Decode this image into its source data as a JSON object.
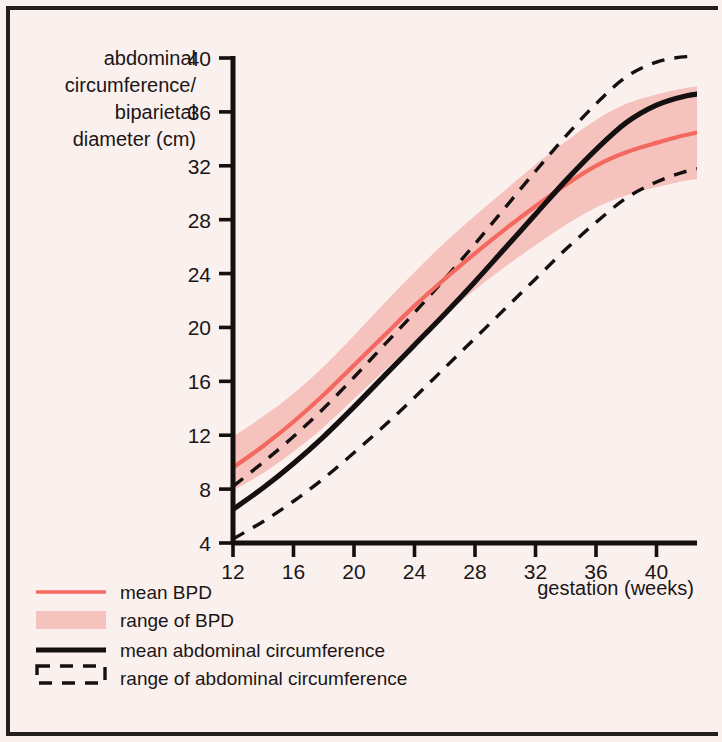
{
  "chart_data": {
    "type": "line",
    "title": "",
    "ylabel_lines": [
      "abdominal",
      "circumference/",
      "biparietal",
      "diameter (cm)"
    ],
    "ylabel": "abdominal circumference/ biparietal diameter (cm)",
    "xlabel": "gestation (weeks)",
    "xlim": [
      12,
      43.5
    ],
    "ylim": [
      4,
      40
    ],
    "xticks": [
      12,
      16,
      20,
      24,
      28,
      32,
      36,
      40
    ],
    "yticks": [
      4,
      8,
      12,
      16,
      20,
      24,
      28,
      32,
      36,
      40
    ],
    "grid": false,
    "legend_position": "below-left",
    "colors": {
      "background": "#faf1ef",
      "bpd_mean_line": "#f4695f",
      "bpd_range_fill": "#f6c2bd",
      "ac_mean_line": "#141010",
      "ac_range_line": "#141010",
      "frame": "#241f1f"
    },
    "x": [
      12,
      14,
      16,
      18,
      20,
      22,
      24,
      26,
      28,
      30,
      32,
      34,
      36,
      38,
      40,
      42,
      43.4
    ],
    "series": [
      {
        "name": "mean BPD",
        "style": "solid-red",
        "values": [
          9.6,
          11.2,
          13.0,
          15.0,
          17.2,
          19.4,
          21.6,
          23.6,
          25.5,
          27.3,
          29.0,
          30.6,
          32.0,
          33.0,
          33.7,
          34.3,
          34.6
        ]
      },
      {
        "name": "range of BPD upper",
        "style": "fill-edge-upper",
        "values": [
          11.9,
          13.4,
          15.1,
          17.1,
          19.4,
          21.8,
          24.1,
          26.3,
          28.3,
          30.2,
          32.1,
          33.8,
          35.4,
          36.6,
          37.3,
          37.8,
          38.0
        ]
      },
      {
        "name": "range of BPD lower",
        "style": "fill-edge-lower",
        "values": [
          7.9,
          9.2,
          10.8,
          12.6,
          14.7,
          16.8,
          18.9,
          20.9,
          22.8,
          24.5,
          26.1,
          27.6,
          28.9,
          29.8,
          30.4,
          30.9,
          31.1
        ]
      },
      {
        "name": "mean abdominal circumference",
        "style": "solid-black",
        "values": [
          6.5,
          8.1,
          9.9,
          11.9,
          14.1,
          16.4,
          18.7,
          21.0,
          23.4,
          25.9,
          28.4,
          30.9,
          33.2,
          35.2,
          36.5,
          37.2,
          37.4
        ]
      },
      {
        "name": "range of abdominal circumference upper",
        "style": "dashed-black-upper",
        "values": [
          8.2,
          10.0,
          11.9,
          14.0,
          16.3,
          18.7,
          21.1,
          23.6,
          26.2,
          28.9,
          31.6,
          34.2,
          36.6,
          38.6,
          39.7,
          40.1,
          40.0
        ]
      },
      {
        "name": "range of abdominal circumference lower",
        "style": "dashed-black-lower",
        "values": [
          4.3,
          5.6,
          7.1,
          8.8,
          10.7,
          12.7,
          14.8,
          17.0,
          19.2,
          21.4,
          23.6,
          25.8,
          27.8,
          29.6,
          30.8,
          31.6,
          31.9
        ]
      }
    ],
    "legend": [
      {
        "label": "mean BPD",
        "swatch": "line-red"
      },
      {
        "label": "range of BPD",
        "swatch": "band-pink"
      },
      {
        "label": "mean abdominal circumference",
        "swatch": "line-black-thick"
      },
      {
        "label": "range of abdominal circumference",
        "swatch": "band-dashed-black"
      }
    ]
  }
}
